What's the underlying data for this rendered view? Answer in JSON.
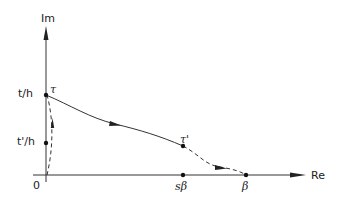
{
  "diagram": {
    "axes": {
      "x_label": "Re",
      "y_label": "Im",
      "origin_label": "0"
    },
    "y_ticks": [
      {
        "label": "t/h"
      },
      {
        "label": "t'/h"
      }
    ],
    "x_points": [
      {
        "label": "sβ"
      },
      {
        "label": "β"
      }
    ],
    "path_points": [
      {
        "label": "τ"
      },
      {
        "label": "τ'"
      }
    ],
    "colors": {
      "ink": "#222222",
      "background": "#ffffff"
    }
  }
}
